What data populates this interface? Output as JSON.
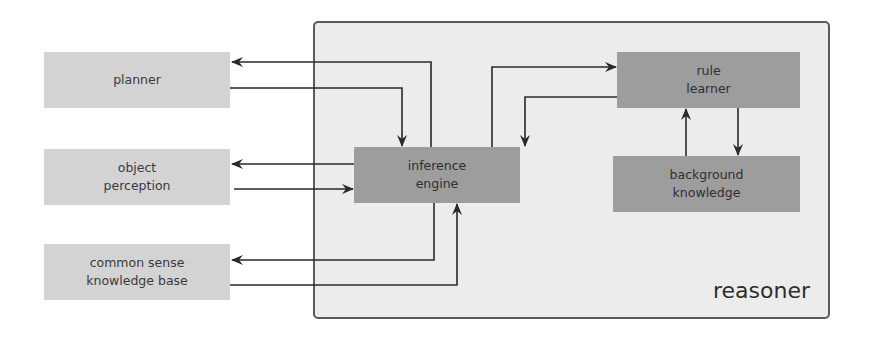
{
  "diagram": {
    "container": {
      "label": "reasoner"
    },
    "external_nodes": [
      {
        "id": "planner",
        "label": "planner"
      },
      {
        "id": "object_perception",
        "label": "object\nperception"
      },
      {
        "id": "common_sense",
        "label": "common sense\nknowledge base"
      }
    ],
    "internal_nodes": [
      {
        "id": "inference_engine",
        "label": "inference\nengine"
      },
      {
        "id": "rule_learner",
        "label": "rule\nlearner"
      },
      {
        "id": "background_knowledge",
        "label": "background\nknowledge"
      }
    ],
    "edges": [
      {
        "from": "inference_engine",
        "to": "planner"
      },
      {
        "from": "planner",
        "to": "inference_engine"
      },
      {
        "from": "inference_engine",
        "to": "object_perception"
      },
      {
        "from": "object_perception",
        "to": "inference_engine"
      },
      {
        "from": "inference_engine",
        "to": "common_sense"
      },
      {
        "from": "common_sense",
        "to": "inference_engine"
      },
      {
        "from": "inference_engine",
        "to": "rule_learner"
      },
      {
        "from": "rule_learner",
        "to": "inference_engine"
      },
      {
        "from": "background_knowledge",
        "to": "rule_learner"
      },
      {
        "from": "rule_learner",
        "to": "background_knowledge"
      }
    ],
    "colors": {
      "external_fill": "#d3d3d3",
      "internal_fill": "#9d9d9d",
      "container_fill": "#ececec",
      "container_border": "#5a5a5a",
      "edge": "#2a2a2a"
    }
  }
}
